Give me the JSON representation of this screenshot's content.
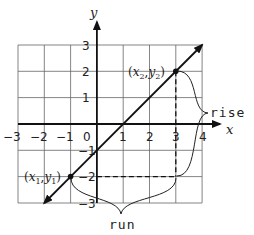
{
  "diagram": {
    "axes": {
      "x_label": "x",
      "y_label": "y",
      "x_ticks": [
        "−3",
        "−2",
        "−1",
        "0",
        "1",
        "2",
        "3",
        "4"
      ],
      "y_ticks": [
        "3",
        "2",
        "1",
        "−1",
        "−2",
        "−3"
      ],
      "x_range": [
        -3,
        4
      ],
      "y_range": [
        -3,
        3
      ]
    },
    "line": {
      "passes_through": [
        [
          -1,
          -2
        ],
        [
          3,
          2
        ]
      ],
      "arrows": "both"
    },
    "points": [
      {
        "id": "p1",
        "x": -1,
        "y": -2,
        "label_open": "(",
        "var_x": "x",
        "sub_x": "1",
        "comma": ",",
        "var_y": "y",
        "sub_y": "1",
        "label_close": ")"
      },
      {
        "id": "p2",
        "x": 3,
        "y": 2,
        "label_open": "(",
        "var_x": "x",
        "sub_x": "2",
        "comma": ",",
        "var_y": "y",
        "sub_y": "2",
        "label_close": ")"
      }
    ],
    "annotations": {
      "rise": "rise",
      "run": "run"
    },
    "colors": {
      "line": "#111111",
      "grid": "#555555",
      "text": "#222222"
    }
  }
}
